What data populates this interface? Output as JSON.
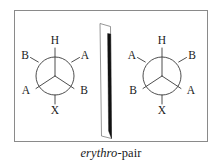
{
  "figure": {
    "caption": {
      "italic_part": "erythro",
      "roman_part": "-pair",
      "full": "erythro-pair"
    },
    "frame": {
      "border_color": "#8a8a8a",
      "background": "#ffffff"
    },
    "mirror_plane": {
      "name": "mirror-plane",
      "fill": "#111111",
      "outline": "#5a5a5a"
    },
    "line_color": "#3a3a3a",
    "label_color": "#1a1a1a",
    "newman_left": {
      "name": "left-newman-projection",
      "front_labels": {
        "top": "H",
        "lower_left": "A",
        "lower_right": "B"
      },
      "back_labels": {
        "upper_left": "B",
        "upper_right": "A",
        "bottom": "X"
      },
      "labels_in_reading_order": [
        "H",
        "B",
        "A",
        "A",
        "B",
        "X"
      ]
    },
    "newman_right": {
      "name": "right-newman-projection",
      "front_labels": {
        "top": "H",
        "lower_left": "B",
        "lower_right": "A"
      },
      "back_labels": {
        "upper_left": "A",
        "upper_right": "B",
        "bottom": "X"
      },
      "labels_in_reading_order": [
        "H",
        "A",
        "B",
        "B",
        "A",
        "X"
      ]
    }
  }
}
